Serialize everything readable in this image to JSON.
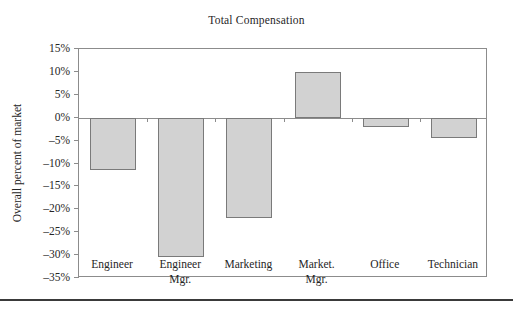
{
  "chart_data": {
    "type": "bar",
    "title": "Total Compensation",
    "xlabel": "",
    "ylabel": "Overall percent of market",
    "categories": [
      "Engineer",
      "Engineer Mgr.",
      "Marketing",
      "Market. Mgr.",
      "Office",
      "Technician"
    ],
    "category_lines": [
      [
        "Engineer",
        ""
      ],
      [
        "Engineer",
        "Mgr."
      ],
      [
        "Marketing",
        ""
      ],
      [
        "Market.",
        "Mgr."
      ],
      [
        "Office",
        ""
      ],
      [
        "Technician",
        ""
      ]
    ],
    "values": [
      -11.5,
      -30.5,
      -22.0,
      10.0,
      -2.0,
      -4.5
    ],
    "value_labels": [
      "-11.5%",
      "-30.5%",
      "-22.0%",
      "10.0%",
      "-2.0%",
      "-4.5%"
    ],
    "ylim": [
      -35,
      15
    ],
    "ytick_values": [
      15,
      10,
      5,
      0,
      -5,
      -10,
      -15,
      -20,
      -25,
      -30,
      -35
    ],
    "ytick_labels": [
      "15%",
      "10%",
      "5%",
      "0%",
      "-5%",
      "-10%",
      "-15%",
      "-20%",
      "-25%",
      "-30%",
      "-35%"
    ],
    "grid": false,
    "legend": "none",
    "bar_fill": "#d2d2d2",
    "bar_edge": "#7a7a7a",
    "axis_color": "#8c8c8c"
  }
}
